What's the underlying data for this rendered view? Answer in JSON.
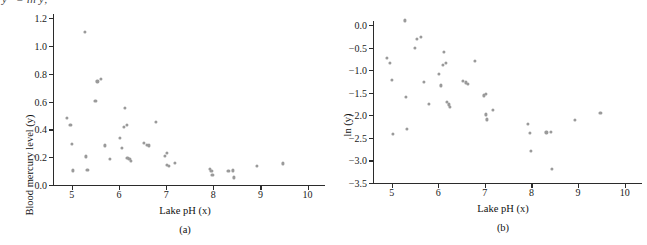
{
  "figure": {
    "cutoff_text": "y* = ln y;",
    "panels": [
      {
        "caption": "(a)",
        "xlabel": "Lake pH (x)",
        "ylabel": "Blood mercury level (y)"
      },
      {
        "caption": "(b)",
        "xlabel": "Lake pH (x)",
        "ylabel": "ln (y)"
      }
    ]
  },
  "chart_data": [
    {
      "type": "scatter",
      "panel": "(a)",
      "title": "",
      "xlabel": "Lake pH (x)",
      "ylabel": "Blood mercury level (y)",
      "xlim": [
        4.6,
        10.2
      ],
      "ylim": [
        0.0,
        1.2
      ],
      "xticks": [
        5,
        6,
        7,
        8,
        9,
        10
      ],
      "xticklabels": [
        "5",
        "6",
        "7",
        "8",
        "9",
        "10"
      ],
      "yticks": [
        0.0,
        0.2,
        0.4,
        0.6,
        0.8,
        1.0,
        1.2
      ],
      "yticklabels": [
        "0.0",
        "0.2",
        "0.4",
        "0.6",
        "0.8",
        "1.0",
        "1.2"
      ],
      "grid": false,
      "legend": null,
      "marker_color": "#9a9a9a",
      "points": [
        [
          4.9,
          0.485
        ],
        [
          4.97,
          0.43
        ],
        [
          5.0,
          0.295
        ],
        [
          5.02,
          0.105
        ],
        [
          5.28,
          1.1
        ],
        [
          5.3,
          0.205
        ],
        [
          5.33,
          0.11
        ],
        [
          5.5,
          0.605
        ],
        [
          5.54,
          0.745
        ],
        [
          5.62,
          0.765
        ],
        [
          5.7,
          0.285
        ],
        [
          5.8,
          0.185
        ],
        [
          6.02,
          0.34
        ],
        [
          6.06,
          0.265
        ],
        [
          6.1,
          0.415
        ],
        [
          6.13,
          0.555
        ],
        [
          6.17,
          0.43
        ],
        [
          6.18,
          0.195
        ],
        [
          6.22,
          0.185
        ],
        [
          6.25,
          0.175
        ],
        [
          6.53,
          0.305
        ],
        [
          6.6,
          0.29
        ],
        [
          6.63,
          0.285
        ],
        [
          6.78,
          0.455
        ],
        [
          6.98,
          0.21
        ],
        [
          7.02,
          0.23
        ],
        [
          7.02,
          0.145
        ],
        [
          7.05,
          0.135
        ],
        [
          7.18,
          0.16
        ],
        [
          7.92,
          0.115
        ],
        [
          7.96,
          0.1
        ],
        [
          7.98,
          0.075
        ],
        [
          8.32,
          0.1
        ],
        [
          8.41,
          0.105
        ],
        [
          8.43,
          0.055
        ],
        [
          8.93,
          0.135
        ],
        [
          9.48,
          0.155
        ]
      ]
    },
    {
      "type": "scatter",
      "panel": "(b)",
      "title": "",
      "xlabel": "Lake pH (x)",
      "ylabel": "ln (y)",
      "xlim": [
        4.6,
        10.2
      ],
      "ylim": [
        -3.5,
        0.0
      ],
      "xticks": [
        5,
        6,
        7,
        8,
        9,
        10
      ],
      "xticklabels": [
        "5",
        "6",
        "7",
        "8",
        "9",
        "10"
      ],
      "yticks": [
        0.0,
        -0.5,
        -1.0,
        -1.5,
        -2.0,
        -2.5,
        -3.0,
        -3.5
      ],
      "yticklabels": [
        "0.0",
        "−0.5",
        "−1.0",
        "−1.5",
        "−2.0",
        "−2.5",
        "−3.0",
        "−3.5"
      ],
      "grid": false,
      "legend": null,
      "marker_color": "#9a9a9a",
      "points": [
        [
          4.9,
          -0.72
        ],
        [
          4.97,
          -0.84
        ],
        [
          5.0,
          -1.22
        ],
        [
          5.02,
          -2.41
        ],
        [
          5.28,
          0.1
        ],
        [
          5.3,
          -1.6
        ],
        [
          5.33,
          -2.31
        ],
        [
          5.5,
          -0.5
        ],
        [
          5.54,
          -0.3
        ],
        [
          5.62,
          -0.27
        ],
        [
          5.7,
          -1.26
        ],
        [
          5.8,
          -1.74
        ],
        [
          6.02,
          -1.08
        ],
        [
          6.06,
          -1.34
        ],
        [
          6.1,
          -0.88
        ],
        [
          6.13,
          -0.59
        ],
        [
          6.17,
          -0.84
        ],
        [
          6.18,
          -1.7
        ],
        [
          6.22,
          -1.76
        ],
        [
          6.25,
          -1.82
        ],
        [
          6.53,
          -1.24
        ],
        [
          6.6,
          -1.27
        ],
        [
          6.63,
          -1.31
        ],
        [
          6.78,
          -0.79
        ],
        [
          6.98,
          -1.56
        ],
        [
          7.02,
          -1.52
        ],
        [
          7.02,
          -1.98
        ],
        [
          7.05,
          -2.09
        ],
        [
          7.18,
          -1.88
        ],
        [
          7.92,
          -2.19
        ],
        [
          7.96,
          -2.39
        ],
        [
          7.98,
          -2.79
        ],
        [
          8.32,
          -2.38
        ],
        [
          8.41,
          -2.37
        ],
        [
          8.43,
          -3.19
        ],
        [
          8.93,
          -2.1
        ],
        [
          9.48,
          -1.94
        ]
      ]
    }
  ]
}
